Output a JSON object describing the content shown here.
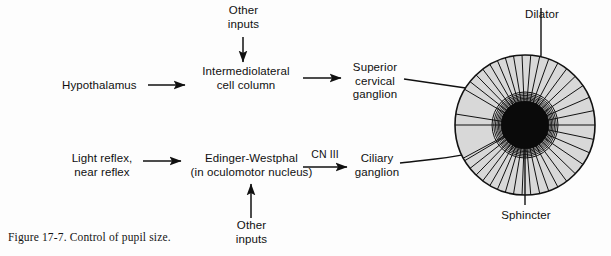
{
  "figure": {
    "caption": "Figure 17-7. Control of pupil size.",
    "number": "17-7",
    "title": "Control of pupil size"
  },
  "nodes": {
    "hypothalamus": "Hypothalamus",
    "other_inputs_top_line1": "Other",
    "other_inputs_top_line2": "inputs",
    "iml_line1": "Intermediolateral",
    "iml_line2": "cell column",
    "scg_line1": "Superior",
    "scg_line2": "cervical",
    "scg_line3": "ganglion",
    "light_reflex_line1": "Light reflex,",
    "light_reflex_line2": "near reflex",
    "ew_line1": "Edinger-Westphal",
    "ew_line2": "(in oculomotor nucleus)",
    "cn_three": "CN III",
    "ciliary_line1": "Ciliary",
    "ciliary_line2": "ganglion",
    "other_inputs_bottom_line1": "Other",
    "other_inputs_bottom_line2": "inputs"
  },
  "iris": {
    "dilator_label": "Dilator",
    "sphincter_label": "Sphincter",
    "center_x": 525,
    "center_y": 125,
    "outer_radius": 71,
    "pupil_radius": 24,
    "sphincter_ring_outer_radius": 33,
    "spoke_count": 30,
    "iris_fill": "#d8d8d8",
    "pupil_fill": "#0a0a0a",
    "stroke": "#111111"
  },
  "colors": {
    "background": "#fdfdfd",
    "ink": "#101010",
    "iris_fill": "#d8d8d8",
    "pupil": "#0a0a0a"
  },
  "pathways": {
    "sympathetic": [
      "Hypothalamus",
      "Intermediolateral cell column",
      "Superior cervical ganglion",
      "Dilator"
    ],
    "parasympathetic": [
      "Light reflex, near reflex",
      "Edinger-Westphal (in oculomotor nucleus)",
      "CN III",
      "Ciliary ganglion",
      "Sphincter"
    ]
  }
}
